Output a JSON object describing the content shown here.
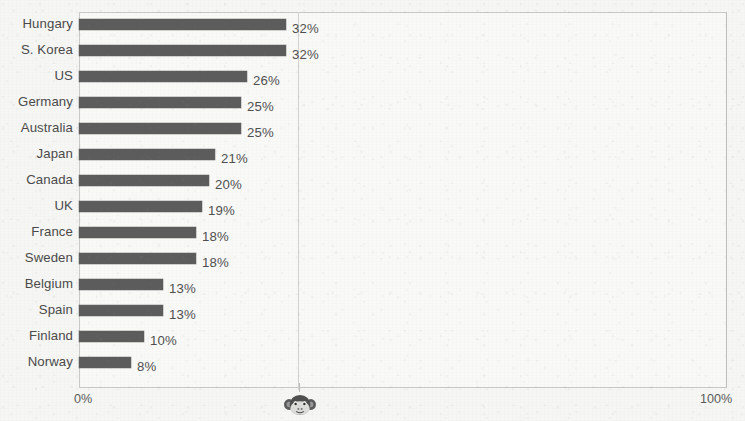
{
  "chart_data": {
    "type": "bar",
    "orientation": "horizontal",
    "title": "",
    "subtitle": "",
    "xlabel": "",
    "ylabel": "",
    "xlim": [
      0,
      100
    ],
    "grid": false,
    "legend": null,
    "value_suffix": "%",
    "categories": [
      "Hungary",
      "S. Korea",
      "US",
      "Germany",
      "Australia",
      "Japan",
      "Canada",
      "UK",
      "France",
      "Sweden",
      "Belgium",
      "Spain",
      "Finland",
      "Norway"
    ],
    "values": [
      32,
      32,
      26,
      25,
      25,
      21,
      20,
      19,
      18,
      18,
      13,
      13,
      10,
      8
    ],
    "value_labels": [
      "32%",
      "32%",
      "26%",
      "25%",
      "25%",
      "21%",
      "20%",
      "19%",
      "18%",
      "18%",
      "13%",
      "13%",
      "10%",
      "8%"
    ],
    "axis_ticks": [
      {
        "value": 0,
        "label": "0%"
      },
      {
        "value": 100,
        "label": "100%"
      }
    ],
    "annotations": [
      {
        "name": "monkey-face-icon",
        "axis_value": 34,
        "label": ""
      }
    ],
    "colors": {
      "bar": "#5c5c5c",
      "text": "#4a4a4a",
      "frame": "#c9c9c7",
      "background": "#f6f6f4",
      "gridline": "#d2d2d0"
    }
  },
  "axis": {
    "min_label": "0%",
    "max_label": "100%"
  },
  "icons": {
    "monkey": "monkey-face-icon"
  }
}
